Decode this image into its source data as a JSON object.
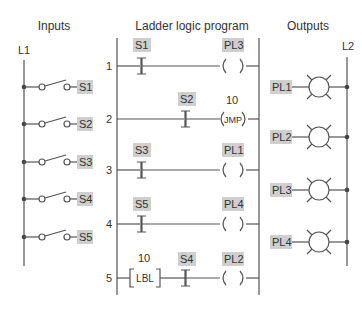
{
  "sections": {
    "inputs_title": "Inputs",
    "program_title": "Ladder logic program",
    "outputs_title": "Outputs"
  },
  "rails": {
    "left": "L1",
    "right": "L2"
  },
  "inputs": [
    {
      "label": "S1"
    },
    {
      "label": "S2"
    },
    {
      "label": "S3"
    },
    {
      "label": "S4"
    },
    {
      "label": "S5"
    }
  ],
  "rungs": [
    {
      "number": "1",
      "contact": "S1",
      "coil": "PL3",
      "coil_text": ""
    },
    {
      "number": "2",
      "contact": "S2",
      "coil": "10",
      "coil_text": "JMP"
    },
    {
      "number": "3",
      "contact": "S3",
      "coil": "PL1",
      "coil_text": ""
    },
    {
      "number": "4",
      "contact": "S5",
      "coil": "PL4",
      "coil_text": ""
    },
    {
      "number": "5",
      "label_num": "10",
      "label_text": "LBL",
      "contact": "S4",
      "coil": "PL2",
      "coil_text": ""
    }
  ],
  "outputs": [
    {
      "label": "PL1"
    },
    {
      "label": "PL2"
    },
    {
      "label": "PL3"
    },
    {
      "label": "PL4"
    }
  ],
  "colors": {
    "tag_bg": "#cfcfcf",
    "line": "#555555"
  }
}
